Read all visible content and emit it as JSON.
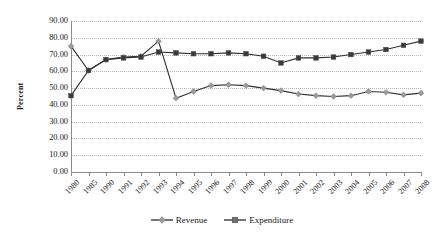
{
  "chart_data": {
    "type": "line",
    "title": "",
    "xlabel": "",
    "ylabel": "Percent",
    "ylim": [
      0,
      90
    ],
    "ytick_step": 10,
    "grid": true,
    "legend_position": "bottom",
    "ytick_labels": [
      "90.00",
      "80.00",
      "70.00",
      "60.00",
      "50.00",
      "40.00",
      "30.00",
      "20.00",
      "10.00",
      "0.00"
    ],
    "categories": [
      "1980",
      "1985",
      "1990",
      "1991",
      "1992",
      "1993",
      "1994",
      "1995",
      "1996",
      "1997",
      "1998",
      "1999",
      "2000",
      "2001",
      "2002",
      "2003",
      "2004",
      "2005",
      "2006",
      "2007",
      "2008"
    ],
    "series": [
      {
        "name": "Revenue",
        "color": "#9a9a9a",
        "marker": "diamond",
        "values": [
          75.0,
          60.5,
          67.0,
          68.5,
          69.0,
          78.0,
          44.0,
          48.0,
          51.5,
          52.0,
          51.5,
          50.0,
          48.5,
          46.5,
          45.5,
          45.0,
          45.5,
          48.0,
          47.5,
          46.0,
          47.0
        ]
      },
      {
        "name": "Expenditure",
        "color": "#3a3a3a",
        "marker": "square",
        "values": [
          45.5,
          60.5,
          67.0,
          68.0,
          68.5,
          71.5,
          71.0,
          70.5,
          70.5,
          71.0,
          70.5,
          69.0,
          65.0,
          68.0,
          68.0,
          68.5,
          70.0,
          71.5,
          73.0,
          75.5,
          78.0
        ]
      }
    ]
  },
  "legend": {
    "items": [
      {
        "label": "Revenue"
      },
      {
        "label": "Expenditure"
      }
    ]
  }
}
